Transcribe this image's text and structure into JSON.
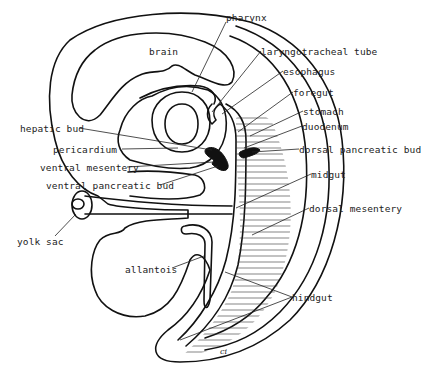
{
  "figure": {
    "type": "labeled embryo sagittal section line drawing",
    "signature": "ci",
    "labels": [
      {
        "id": "pharynx",
        "text": "pharynx",
        "x": 225,
        "y": 17
      },
      {
        "id": "brain",
        "text": "brain",
        "x": 149,
        "y": 46
      },
      {
        "id": "laryngotracheal-tube",
        "text": "laryngotracheal tube",
        "x": 261,
        "y": 46
      },
      {
        "id": "esophagus",
        "text": "esophagus",
        "x": 283,
        "y": 66
      },
      {
        "id": "foregut",
        "text": "foregut",
        "x": 293,
        "y": 87
      },
      {
        "id": "stomach",
        "text": "stomach",
        "x": 303,
        "y": 106
      },
      {
        "id": "hepatic-bud",
        "text": "hepatic bud",
        "x": 20,
        "y": 123
      },
      {
        "id": "duodenum",
        "text": "duodenum",
        "x": 302,
        "y": 121
      },
      {
        "id": "pericardium",
        "text": "pericardium",
        "x": 53,
        "y": 144
      },
      {
        "id": "dorsal-pancreatic-bud",
        "text": "dorsal pancreatic bud",
        "x": 299,
        "y": 144
      },
      {
        "id": "ventral-mesentery",
        "text": "ventral mesentery",
        "x": 40,
        "y": 162
      },
      {
        "id": "ventral-pancreatic-bud",
        "text": "ventral pancreatic bud",
        "x": 46,
        "y": 180
      },
      {
        "id": "midgut",
        "text": "midgut",
        "x": 311,
        "y": 169
      },
      {
        "id": "dorsal-mesentery",
        "text": "dorsal mesentery",
        "x": 309,
        "y": 203
      },
      {
        "id": "yolk-sac",
        "text": "yolk sac",
        "x": 17,
        "y": 236
      },
      {
        "id": "allantois",
        "text": "allantois",
        "x": 125,
        "y": 264
      },
      {
        "id": "hindgut",
        "text": "hindgut",
        "x": 292,
        "y": 292
      }
    ]
  }
}
